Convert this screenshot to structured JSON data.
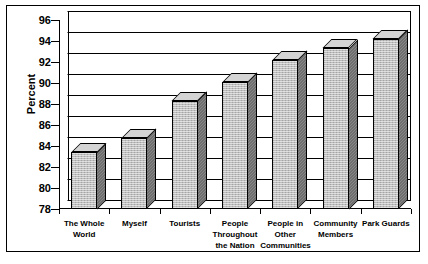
{
  "chart_data": {
    "type": "bar",
    "title": "",
    "xlabel": "",
    "ylabel": "Percent",
    "ylim": [
      78,
      96
    ],
    "ytick_step": 2,
    "yticks": [
      96,
      94,
      92,
      90,
      88,
      86,
      84,
      82,
      80,
      78
    ],
    "grid": true,
    "legend": "none",
    "three_d": true,
    "categories": [
      "The Whole World",
      "Myself",
      "Tourists",
      "People Throughout the Nation",
      "People in Other Communities",
      "Community Members",
      "Park Guards"
    ],
    "category_lines": [
      [
        "The Whole",
        "World"
      ],
      [
        "Myself"
      ],
      [
        "Tourists"
      ],
      [
        "People",
        "Throughout",
        "the Nation"
      ],
      [
        "People in",
        "Other",
        "Communities"
      ],
      [
        "Community",
        "Members"
      ],
      [
        "Park Guards"
      ]
    ],
    "values": [
      83.4,
      84.8,
      88.3,
      90.1,
      92.2,
      93.3,
      94.2
    ],
    "series": [
      {
        "name": "Percent",
        "values": [
          83.4,
          84.8,
          88.3,
          90.1,
          92.2,
          93.3,
          94.2
        ]
      }
    ]
  },
  "colors": {
    "bar_front": "#bdbdbd",
    "bar_side": "#6e6e6e",
    "bar_top": "#d4d4d4",
    "axis": "#000000",
    "background": "#ffffff"
  }
}
